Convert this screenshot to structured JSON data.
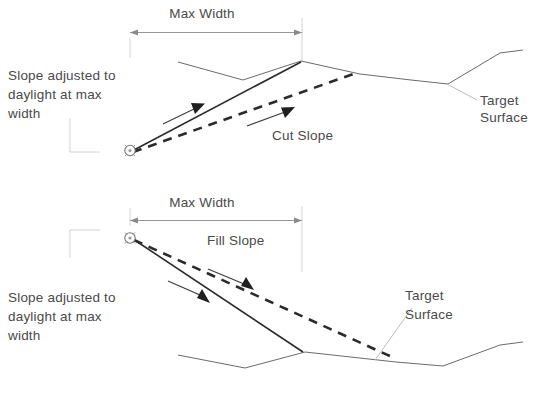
{
  "diagram": {
    "colors": {
      "terrain_line": "#6b6b6b",
      "slope_solid": "#2b2b2b",
      "slope_dashed": "#2b2b2b",
      "dimension_line": "#8a8a8a",
      "leader_line": "#b4b4b4",
      "text": "#4a4a4a",
      "background": "#ffffff"
    },
    "panels": [
      {
        "id": "cut-panel",
        "dimension_label": "Max Width",
        "slope_label": "Cut Slope",
        "target_label_line1": "Target",
        "target_label_line2": "Surface",
        "note_line1": "Slope adjusted to",
        "note_line2": "daylight at max",
        "note_line3": "width"
      },
      {
        "id": "fill-panel",
        "dimension_label": "Max Width",
        "slope_label": "Fill Slope",
        "target_label_line1": "Target",
        "target_label_line2": "Surface",
        "note_line1": "Slope adjusted to",
        "note_line2": "daylight at max",
        "note_line3": "width"
      }
    ]
  }
}
